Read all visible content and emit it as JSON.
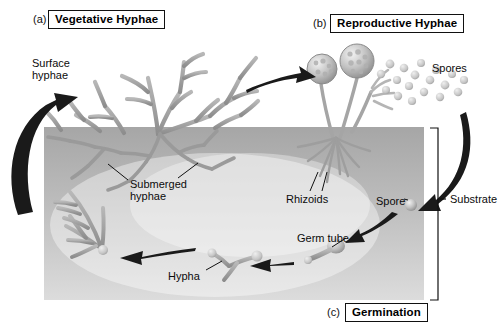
{
  "figure": {
    "background_color": "#ffffff",
    "ink_color": "#111111"
  },
  "substrate_block": {
    "label": "Substrate",
    "x": 44,
    "y": 127,
    "width": 380,
    "height": 173,
    "fill_top_color": "#a9a9a9",
    "fill_bottom_color": "#d8d8d8",
    "bracket_x": 437,
    "bracket_top": 128,
    "bracket_bottom": 300
  },
  "panels": [
    {
      "id": "a",
      "key": "vegetative",
      "tag": "(a)",
      "title": "Vegetative Hyphae",
      "box_x": 48,
      "box_y": 10
    },
    {
      "id": "b",
      "key": "reproductive",
      "tag": "(b)",
      "title": "Reproductive Hyphae",
      "box_x": 330,
      "box_y": 14
    },
    {
      "id": "c",
      "key": "germination",
      "tag": "(c)",
      "title": "Germination",
      "box_x": 345,
      "box_y": 303
    }
  ],
  "labels": [
    {
      "name": "surface-hyphae",
      "text": "Surface\nhyphae",
      "x": 32,
      "y": 57
    },
    {
      "name": "submerged-hyphae",
      "text": "Submerged\nhyphae",
      "x": 130,
      "y": 178
    },
    {
      "name": "hypha",
      "text": "Hypha",
      "x": 168,
      "y": 270
    },
    {
      "name": "rhizoids",
      "text": "Rhizoids",
      "x": 286,
      "y": 193
    },
    {
      "name": "spores",
      "text": "Spores",
      "x": 432,
      "y": 62
    },
    {
      "name": "spore",
      "text": "Spore",
      "x": 376,
      "y": 195
    },
    {
      "name": "germ-tube",
      "text": "Germ tube",
      "x": 297,
      "y": 232
    },
    {
      "name": "substrate",
      "text": "Substrate",
      "x": 450,
      "y": 196
    }
  ],
  "spore_cloud": {
    "count": 18,
    "color": "#c9c9c9",
    "points": [
      [
        381,
        74
      ],
      [
        390,
        64
      ],
      [
        397,
        80
      ],
      [
        404,
        68
      ],
      [
        409,
        86
      ],
      [
        415,
        75
      ],
      [
        421,
        63
      ],
      [
        424,
        92
      ],
      [
        430,
        80
      ],
      [
        436,
        70
      ],
      [
        440,
        97
      ],
      [
        445,
        85
      ],
      [
        452,
        74
      ],
      [
        458,
        92
      ],
      [
        464,
        80
      ],
      [
        386,
        90
      ],
      [
        398,
        96
      ],
      [
        412,
        101
      ]
    ]
  },
  "sporangia": [
    {
      "name": "sporangium-left",
      "cx": 321,
      "cy": 69,
      "r": 15,
      "stalk_to": [
        332,
        136
      ]
    },
    {
      "name": "sporangium-right",
      "cx": 357,
      "cy": 61,
      "r": 17,
      "stalk_to": [
        340,
        136
      ]
    }
  ],
  "cycle_arrows": [
    {
      "name": "arrow-germination-to-vegetative",
      "direction": "up-left-curve"
    },
    {
      "name": "arrow-vegetative-to-reproductive",
      "direction": "right"
    },
    {
      "name": "arrow-spores-to-substrate",
      "direction": "down-curve"
    },
    {
      "name": "arrow-spore-to-germtube",
      "direction": "down-left"
    },
    {
      "name": "arrow-germtube-to-hypha",
      "direction": "left"
    }
  ]
}
